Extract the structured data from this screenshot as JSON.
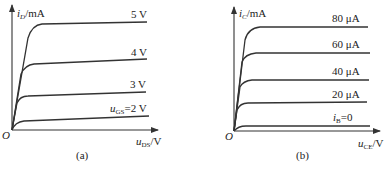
{
  "panels": [
    {
      "id": "a",
      "caption": "(a)",
      "y_axis": {
        "var": "i",
        "sub": "D",
        "unit": "/mA"
      },
      "x_axis": {
        "var": "u",
        "sub": "DS",
        "unit": "/V"
      },
      "origin": "O",
      "curves": [
        {
          "label": "5 V"
        },
        {
          "label": "4 V"
        },
        {
          "label": "3 V"
        },
        {
          "label_var": "u",
          "label_sub": "GS",
          "label_rest": "=2 V"
        }
      ]
    },
    {
      "id": "b",
      "caption": "(b)",
      "y_axis": {
        "var": "i",
        "sub": "C",
        "unit": "/mA"
      },
      "x_axis": {
        "var": "u",
        "sub": "CE",
        "unit": "/V"
      },
      "origin": "O",
      "curves": [
        {
          "label": "80 μA"
        },
        {
          "label": "60 μA"
        },
        {
          "label": "40 μA"
        },
        {
          "label": "20 μA"
        },
        {
          "label_var": "i",
          "label_sub": "B",
          "label_rest": "=0"
        }
      ]
    }
  ]
}
